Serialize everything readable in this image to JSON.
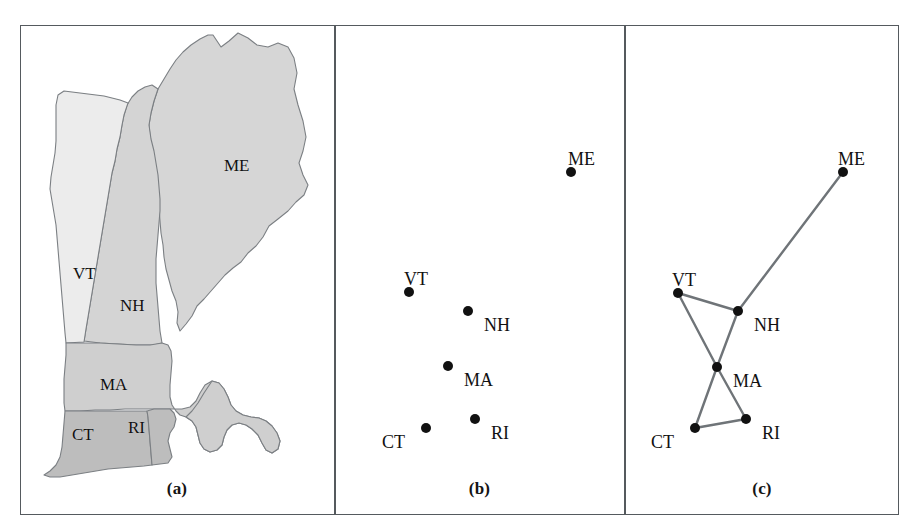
{
  "figure": {
    "panels": [
      {
        "id": "a",
        "caption": "(a)",
        "kind": "choropleth-map"
      },
      {
        "id": "b",
        "caption": "(b)",
        "kind": "point-scatter"
      },
      {
        "id": "c",
        "caption": "(c)",
        "kind": "adjacency-graph"
      }
    ]
  },
  "colors": {
    "frame": "#555a5e",
    "node_fill": "#111111",
    "edge": "#6f7478",
    "map_outline": "#7b7f83",
    "map_fill_vt": "#ececec",
    "map_fill_nh": "#d4d4d4",
    "map_fill_me": "#d6d6d6",
    "map_fill_ma": "#cfcfcf",
    "map_fill_ct": "#bdbdbd",
    "map_fill_ri": "#bdbdbd",
    "background": "#ffffff",
    "label_text": "#111111"
  },
  "map": {
    "labels": [
      {
        "code": "ME",
        "x": 224,
        "y": 157
      },
      {
        "code": "VT",
        "x": 73,
        "y": 265
      },
      {
        "code": "NH",
        "x": 120,
        "y": 297
      },
      {
        "code": "MA",
        "x": 100,
        "y": 376
      },
      {
        "code": "CT",
        "x": 72,
        "y": 426
      },
      {
        "code": "RI",
        "x": 128,
        "y": 419
      }
    ]
  },
  "chart_data": {
    "type": "scatter",
    "xlabel": "",
    "ylabel": "",
    "nodes": [
      {
        "id": "ME",
        "label": "ME",
        "x": 571,
        "y": 172,
        "label_x": 568,
        "label_y": 150,
        "label_anchor": "above"
      },
      {
        "id": "VT",
        "label": "VT",
        "x": 409,
        "y": 292,
        "label_x": 404,
        "label_y": 270,
        "label_anchor": "above"
      },
      {
        "id": "NH",
        "label": "NH",
        "x": 468,
        "y": 311,
        "label_x": 484,
        "label_y": 316,
        "label_anchor": "right"
      },
      {
        "id": "MA",
        "label": "MA",
        "x": 448,
        "y": 366,
        "label_x": 464,
        "label_y": 371,
        "label_anchor": "right"
      },
      {
        "id": "RI",
        "label": "RI",
        "x": 475,
        "y": 419,
        "label_x": 491,
        "label_y": 424,
        "label_anchor": "right"
      },
      {
        "id": "CT",
        "label": "CT",
        "x": 426,
        "y": 428,
        "label_x": 382,
        "label_y": 433,
        "label_anchor": "left"
      }
    ],
    "graph_nodes": [
      {
        "id": "ME",
        "label": "ME",
        "x": 843,
        "y": 172,
        "label_x": 838,
        "label_y": 150,
        "label_anchor": "above"
      },
      {
        "id": "VT",
        "label": "VT",
        "x": 678,
        "y": 293,
        "label_x": 672,
        "label_y": 271,
        "label_anchor": "above"
      },
      {
        "id": "NH",
        "label": "NH",
        "x": 738,
        "y": 311,
        "label_x": 754,
        "label_y": 316,
        "label_anchor": "right"
      },
      {
        "id": "MA",
        "label": "MA",
        "x": 717,
        "y": 367,
        "label_x": 733,
        "label_y": 372,
        "label_anchor": "right"
      },
      {
        "id": "RI",
        "label": "RI",
        "x": 746,
        "y": 419,
        "label_x": 762,
        "label_y": 424,
        "label_anchor": "right"
      },
      {
        "id": "CT",
        "label": "CT",
        "x": 695,
        "y": 428,
        "label_x": 651,
        "label_y": 433,
        "label_anchor": "left"
      }
    ],
    "edges": [
      {
        "from": "ME",
        "to": "NH"
      },
      {
        "from": "VT",
        "to": "NH"
      },
      {
        "from": "VT",
        "to": "MA"
      },
      {
        "from": "NH",
        "to": "MA"
      },
      {
        "from": "MA",
        "to": "CT"
      },
      {
        "from": "MA",
        "to": "RI"
      },
      {
        "from": "CT",
        "to": "RI"
      }
    ],
    "node_radius": 5,
    "edge_width": 2.4,
    "grid": false,
    "legend": "none"
  }
}
